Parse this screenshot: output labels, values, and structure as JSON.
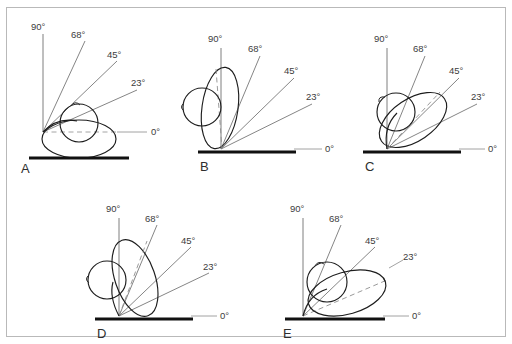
{
  "figure": {
    "background_color": "#ffffff",
    "border_color": "#b9b9b9",
    "line_color": "#1d1d1d",
    "ray_color": "#6f6f6f",
    "baseline_color": "#111111"
  },
  "angle_labels": {
    "a90": "90°",
    "a68": "68°",
    "a45": "45°",
    "a23": "23°",
    "a0": "0°"
  },
  "panels": [
    {
      "letter": "A",
      "orientation_deg": 0,
      "description": "oval body axis horizontal at 0 degrees, circular head upper-centre"
    },
    {
      "letter": "B",
      "orientation_deg": 90,
      "description": "oval body axis vertical at 90 degrees, circular head to the left"
    },
    {
      "letter": "C",
      "orientation_deg": 45,
      "description": "oval body axis inclined at 45 degrees, circular head upper-left"
    },
    {
      "letter": "D",
      "orientation_deg": 68,
      "description": "oval body axis inclined at 68 degrees, circular head lower-left"
    },
    {
      "letter": "E",
      "orientation_deg": 23,
      "description": "oval body axis inclined at 23 degrees, circular head upper-left"
    }
  ]
}
